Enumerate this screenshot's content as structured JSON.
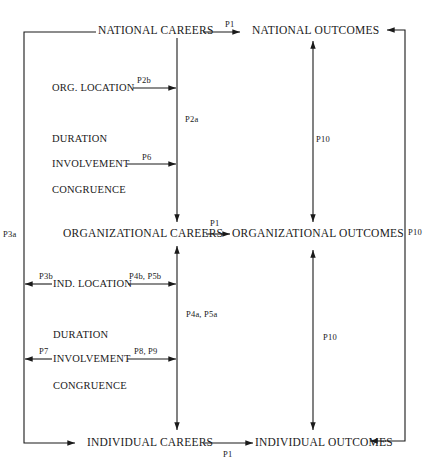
{
  "nodes": {
    "national_careers": "NATIONAL CAREERS",
    "national_outcomes": "NATIONAL OUTCOMES",
    "organizational_careers": "ORGANIZATIONAL CAREERS",
    "organizational_outcomes": "ORGANIZATIONAL OUTCOMES",
    "individual_careers": "INDIVIDUAL CAREERS",
    "individual_outcomes": "INDIVIDUAL OUTCOMES"
  },
  "org_factors": {
    "location": "ORG. LOCATION",
    "duration": "DURATION",
    "involvement": "INVOLVEMENT",
    "congruence": "CONGRUENCE"
  },
  "ind_factors": {
    "location": "IND. LOCATION",
    "duration": "DURATION",
    "involvement": "INVOLVEMENT",
    "congruence": "CONGRUENCE"
  },
  "paths": {
    "p1_national": "P1",
    "p1_organizational": "P1",
    "p1_individual": "P1",
    "p2a": "P2a",
    "p2b": "P2b",
    "p3a": "P3a",
    "p3b": "P3b",
    "p4a_p5a": "P4a, P5a",
    "p4b_p5b": "P4b, P5b",
    "p6": "P6",
    "p7": "P7",
    "p8_p9": "P8, P9",
    "p10_upper": "P10",
    "p10_lower": "P10",
    "p10_right": "P10"
  },
  "colors": {
    "line": "#1a1a1a",
    "background": "#ffffff"
  }
}
